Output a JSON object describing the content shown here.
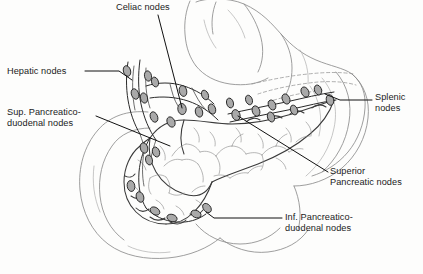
{
  "figure": {
    "background_color": "#fdfdfc",
    "ink_color": "#1b1b1b",
    "node_fill_color": "#a9a9a9",
    "node_outline_color": "#1f1f1f",
    "organ_line_color": "#8d8d8d",
    "pancreas_line_color": "#3a3a3a",
    "leader_line_color": "#111111"
  },
  "labels": [
    {
      "id": "celiac",
      "name": "Celiac nodes",
      "lines": [
        "Celiac nodes"
      ],
      "x": 116,
      "y": 2,
      "align": "left"
    },
    {
      "id": "hepatic",
      "name": "Hepatic nodes",
      "lines": [
        "Hepatic nodes"
      ],
      "x": 7,
      "y": 66,
      "align": "left"
    },
    {
      "id": "sup-pancreaticoduodenal",
      "name": "Sup. Pancreatico-duodenal nodes",
      "lines": [
        "Sup. Pancreatico-",
        "duodenal nodes"
      ],
      "x": 7,
      "y": 107,
      "align": "left"
    },
    {
      "id": "splenic",
      "name": "Splenic nodes",
      "lines": [
        "Splenic",
        "nodes"
      ],
      "x": 375,
      "y": 92,
      "align": "left"
    },
    {
      "id": "superior-pancreatic",
      "name": "Superior Pancreatic nodes",
      "lines": [
        "Superior",
        "Pancreatic nodes"
      ],
      "x": 330,
      "y": 166,
      "align": "left"
    },
    {
      "id": "inf-pancreaticoduodenal",
      "name": "Inf. Pancreatico-duodenal nodes",
      "lines": [
        "Inf. Pancreatico-",
        "duodenal nodes"
      ],
      "x": 285,
      "y": 212,
      "align": "left"
    }
  ],
  "organs": [
    {
      "id": "stomach",
      "name": "Stomach"
    },
    {
      "id": "duodenum",
      "name": "Duodenum"
    },
    {
      "id": "pancreas",
      "name": "Pancreas"
    },
    {
      "id": "spleen-region",
      "name": "Splenic region"
    }
  ],
  "node_groups": [
    {
      "id": "hepatic",
      "name": "Hepatic nodes",
      "count": 6
    },
    {
      "id": "celiac",
      "name": "Celiac nodes",
      "count": 5
    },
    {
      "id": "splenic",
      "name": "Splenic nodes",
      "count": 6
    },
    {
      "id": "superior-pancreatic",
      "name": "Superior Pancreatic nodes",
      "count": 5
    },
    {
      "id": "sup-pancreaticoduodenal",
      "name": "Sup. Pancreaticoduodenal nodes",
      "count": 4
    },
    {
      "id": "inf-pancreaticoduodenal",
      "name": "Inf. Pancreaticoduodenal nodes",
      "count": 6
    }
  ]
}
